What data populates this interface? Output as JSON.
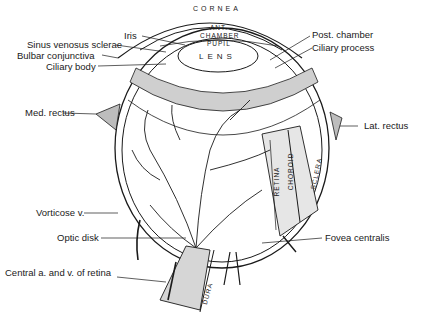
{
  "diagram": {
    "labels_left": [
      {
        "id": "iris",
        "text": "Iris"
      },
      {
        "id": "sinus-venosus-sclerae",
        "text": "Sinus venosus sclerae"
      },
      {
        "id": "bulbar-conjunctiva",
        "text": "Bulbar conjunctiva"
      },
      {
        "id": "ciliary-body",
        "text": "Ciliary body"
      },
      {
        "id": "med-rectus",
        "text": "Med. rectus"
      },
      {
        "id": "vorticose-v",
        "text": "Vorticose v."
      },
      {
        "id": "optic-disk",
        "text": "Optic disk"
      },
      {
        "id": "central-a-v-retina",
        "text": "Central a. and v. of retina"
      }
    ],
    "labels_right": [
      {
        "id": "post-chamber",
        "text": "Post. chamber"
      },
      {
        "id": "ciliary-process",
        "text": "Ciliary process"
      },
      {
        "id": "lat-rectus",
        "text": "Lat. rectus"
      },
      {
        "id": "fovea-centralis",
        "text": "Fovea centralis"
      }
    ],
    "inner_labels": {
      "cornea": "CORNEA",
      "ant_chamber_1": "ANT.",
      "ant_chamber_2": "CHAMBER",
      "pupil": "PUPIL",
      "lens": "LENS",
      "retina": "RETINA",
      "choroid": "CHOROID",
      "sclera": "SCLERA",
      "dura": "DURA"
    }
  }
}
